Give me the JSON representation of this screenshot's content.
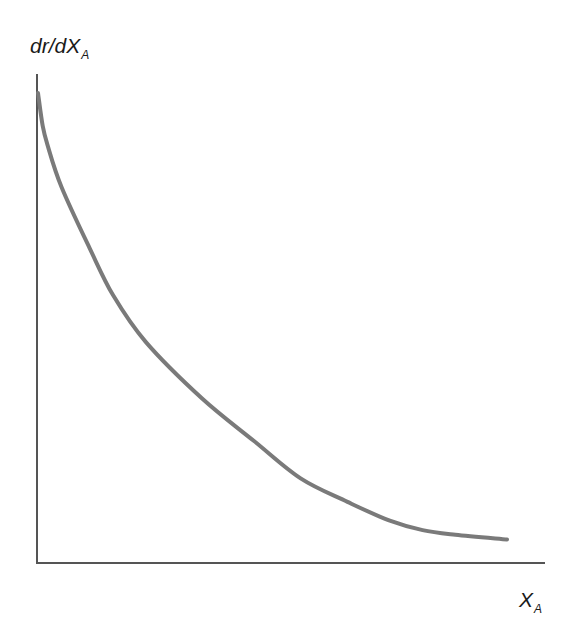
{
  "chart_data": {
    "type": "line",
    "title": "",
    "xlabel": "X_A",
    "ylabel": "dr/dX_A",
    "xlabel_main": "X",
    "xlabel_sub": "A",
    "ylabel_main": "dr/dX",
    "ylabel_sub": "A",
    "grid": false,
    "legend": null,
    "ticks": {
      "x": [],
      "y": []
    },
    "series": [
      {
        "name": "dr/dX_A vs X_A",
        "color": "#7a7a7a",
        "description": "Monotonically decreasing convex curve, steep near X_A=0 and flattening toward a small positive value",
        "x": [
          0.0,
          0.01,
          0.02,
          0.05,
          0.11,
          0.16,
          0.23,
          0.35,
          0.46,
          0.56,
          0.66,
          0.75,
          0.82,
          0.89,
          1.0
        ],
        "y": [
          1.0,
          0.93,
          0.89,
          0.8,
          0.67,
          0.57,
          0.47,
          0.35,
          0.26,
          0.18,
          0.13,
          0.09,
          0.07,
          0.06,
          0.05
        ]
      }
    ],
    "xlim": [
      0,
      1
    ],
    "ylim": [
      0,
      1.05
    ]
  },
  "axes": {
    "color": "#555555"
  }
}
